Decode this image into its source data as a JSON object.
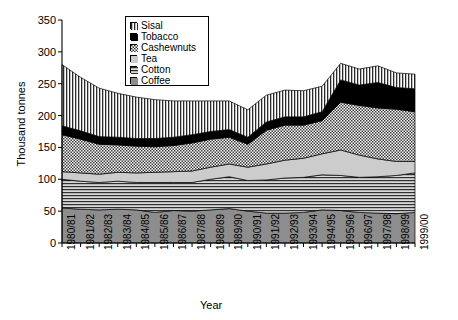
{
  "chart_data": {
    "type": "area",
    "title": "",
    "xlabel": "Year",
    "ylabel": "Thousand tonnes",
    "ylim": [
      0,
      350
    ],
    "ytick_step": 50,
    "yticks": [
      0,
      50,
      100,
      150,
      200,
      250,
      300,
      350
    ],
    "grid": false,
    "stacked": true,
    "legend_position": "top-center",
    "categories": [
      "1980/81",
      "1981/82",
      "1982/83",
      "1983/84",
      "1984/85",
      "1985/86",
      "1986/87",
      "1987/88",
      "1988/89",
      "1989/90",
      "1990/91",
      "1991/92",
      "1992/93",
      "1993/94",
      "1994/95",
      "1995/96",
      "1996/97",
      "1997/98",
      "1998/99",
      "1999/00"
    ],
    "series": [
      {
        "name": "Coffee",
        "pattern": "solid-gray",
        "color": "#8a8a8a",
        "values": [
          55,
          53,
          52,
          53,
          52,
          48,
          51,
          50,
          52,
          54,
          50,
          47,
          47,
          48,
          52,
          51,
          48,
          47,
          46,
          48
        ]
      },
      {
        "name": "Cotton",
        "pattern": "horizontal-lines",
        "color": "#d0d0d0",
        "values": [
          45,
          44,
          43,
          44,
          43,
          47,
          44,
          45,
          48,
          50,
          48,
          52,
          55,
          55,
          55,
          55,
          55,
          57,
          60,
          62
        ]
      },
      {
        "name": "Tea",
        "pattern": "light-gray",
        "color": "#c8c8c8",
        "values": [
          12,
          13,
          13,
          14,
          15,
          16,
          17,
          18,
          19,
          20,
          21,
          25,
          28,
          30,
          33,
          40,
          35,
          28,
          22,
          18
        ]
      },
      {
        "name": "Cashewnuts",
        "pattern": "checker",
        "color": "#b8b8b8",
        "values": [
          58,
          53,
          47,
          43,
          42,
          40,
          41,
          44,
          44,
          42,
          36,
          53,
          55,
          52,
          52,
          75,
          78,
          80,
          82,
          78
        ]
      },
      {
        "name": "Tobacco",
        "pattern": "solid-black",
        "color": "#000000",
        "values": [
          14,
          13,
          12,
          12,
          12,
          13,
          13,
          13,
          12,
          12,
          11,
          13,
          13,
          13,
          14,
          35,
          32,
          40,
          34,
          36
        ]
      },
      {
        "name": "Sisal",
        "pattern": "vertical-lines",
        "color": "#ffffff",
        "values": [
          96,
          84,
          76,
          69,
          65,
          61,
          57,
          53,
          48,
          45,
          43,
          42,
          42,
          41,
          40,
          26,
          25,
          26,
          23,
          23
        ]
      }
    ],
    "totals": [
      280,
      260,
      243,
      235,
      229,
      225,
      223,
      223,
      223,
      223,
      209,
      232,
      240,
      239,
      246,
      282,
      273,
      278,
      267,
      265
    ]
  }
}
